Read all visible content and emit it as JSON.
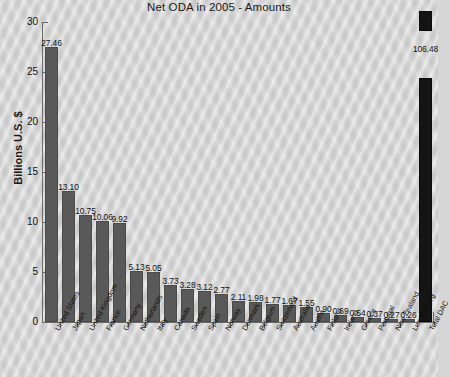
{
  "chart_data": {
    "type": "bar",
    "title": "Net ODA in 2005 - Amounts",
    "xlabel": "",
    "ylabel": "Billions U.S. $",
    "ylim": [
      0,
      30
    ],
    "yticks": [
      0,
      5,
      10,
      15,
      20,
      25,
      30
    ],
    "ytick_labels": [
      "0",
      "5",
      "10",
      "15",
      "20",
      "25",
      "30"
    ],
    "grid": false,
    "legend": null,
    "note": "Final bar 'Total DAC' (106.48) exceeds the axis maximum and is drawn clipped/broken.",
    "categories": [
      "United States",
      "Japan",
      "United Kingdom",
      "France",
      "Germany",
      "Netherlands",
      "Italy",
      "Canada",
      "Sweden",
      "Spain",
      "Norway",
      "Denmark",
      "Belgium",
      "Switzerland",
      "Australia",
      "Austria",
      "Finland",
      "Ireland",
      "Greece",
      "Portugal",
      "New Zealand",
      "Luxembourg",
      "Total DAC"
    ],
    "values": [
      27.46,
      13.1,
      10.75,
      10.06,
      9.92,
      5.13,
      5.05,
      3.73,
      3.28,
      3.12,
      2.77,
      2.11,
      1.98,
      1.77,
      1.67,
      1.55,
      0.9,
      0.69,
      0.54,
      0.37,
      0.27,
      0.26,
      106.48
    ],
    "value_labels": [
      "27.46",
      "13.10",
      "10.75",
      "10.06",
      "9.92",
      "5.13",
      "5.05",
      "3.73",
      "3.28",
      "3.12",
      "2.77",
      "2.11",
      "1.98",
      "1.77",
      "1.67",
      "1.55",
      "0.90",
      "0.69",
      "0.54",
      "0.37",
      "0.27",
      "0.26",
      "106.48"
    ],
    "colors": {
      "bar": "#595959",
      "bar_overflow": "#141414",
      "background": "#d5d5d5",
      "axis": "#6a6a6a",
      "text": "#111111"
    }
  }
}
